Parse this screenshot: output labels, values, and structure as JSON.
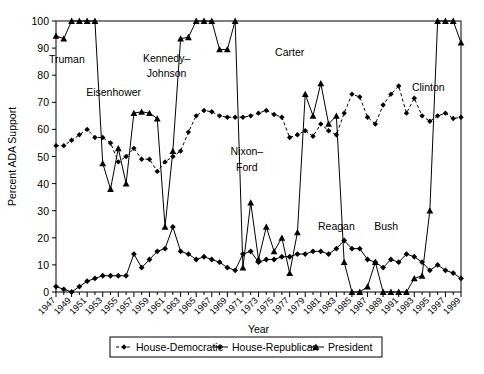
{
  "chart_data": {
    "type": "line",
    "title": "",
    "xlabel": "Year",
    "ylabel": "Percent ADA Support",
    "xlim": [
      1947,
      1999
    ],
    "ylim": [
      0,
      100
    ],
    "yticks": [
      0,
      10,
      20,
      30,
      40,
      50,
      60,
      70,
      80,
      90,
      100
    ],
    "grid": false,
    "legend_position": "bottom",
    "x": [
      1947,
      1948,
      1949,
      1950,
      1951,
      1952,
      1953,
      1954,
      1955,
      1956,
      1957,
      1958,
      1959,
      1960,
      1961,
      1962,
      1963,
      1964,
      1965,
      1966,
      1967,
      1968,
      1969,
      1970,
      1971,
      1972,
      1973,
      1974,
      1975,
      1976,
      1977,
      1978,
      1979,
      1980,
      1981,
      1982,
      1983,
      1984,
      1985,
      1986,
      1987,
      1988,
      1989,
      1990,
      1991,
      1992,
      1993,
      1994,
      1995,
      1996,
      1997,
      1998,
      1999
    ],
    "xtick_labels": [
      "1947",
      "1949",
      "1951",
      "1953",
      "1955",
      "1957",
      "1959",
      "1961",
      "1963",
      "1965",
      "1967",
      "1969",
      "1971",
      "1973",
      "1975",
      "1977",
      "1979",
      "1981",
      "1983",
      "1985",
      "1987",
      "1989",
      "1991",
      "1993",
      "1995",
      "1997",
      "1999"
    ],
    "series": [
      {
        "name": "House-Democratic",
        "marker": "diamond",
        "linestyle": "dashed",
        "color": "#000000",
        "values": [
          54,
          54,
          56,
          58,
          60,
          57,
          57,
          55,
          48,
          50,
          53,
          49,
          49,
          44.5,
          48,
          50,
          52,
          59,
          65,
          67,
          66.5,
          65,
          64.5,
          64.5,
          64.5,
          65,
          66,
          67,
          65.5,
          64.5,
          57,
          58,
          59.5,
          57.5,
          62,
          59.5,
          58,
          66,
          73,
          72,
          64.5,
          62,
          69,
          73,
          76,
          66,
          71.5,
          65,
          63,
          65,
          66,
          64,
          64.5
        ]
      },
      {
        "name": "House-Republican",
        "marker": "filled-diamond",
        "linestyle": "solid",
        "color": "#000000",
        "values": [
          2,
          1,
          0,
          2,
          4,
          5,
          6,
          6,
          6,
          6,
          14,
          9,
          12,
          15,
          16,
          24,
          15,
          14,
          12,
          13,
          12,
          11,
          9,
          8,
          14,
          15,
          11,
          12,
          12,
          13,
          13,
          14,
          14,
          15,
          15,
          14,
          16,
          19,
          16,
          16,
          12,
          11,
          9,
          12,
          11,
          14,
          13,
          11,
          8,
          10,
          8,
          7,
          5
        ]
      },
      {
        "name": "President",
        "marker": "triangle",
        "linestyle": "solid",
        "color": "#000000",
        "values": [
          94.5,
          93.5,
          100,
          100,
          100,
          100,
          47.5,
          38,
          53,
          40,
          66,
          66.5,
          66,
          64,
          24,
          52,
          93.5,
          94,
          100,
          100,
          100,
          89.5,
          89.5,
          100,
          9,
          33,
          12,
          24,
          15,
          20,
          7,
          22,
          73,
          65,
          77,
          62,
          65,
          11,
          0,
          0,
          2,
          11,
          0,
          0,
          0,
          0,
          5,
          6,
          30,
          100,
          100,
          100,
          92
        ]
      }
    ],
    "annotations": [
      {
        "text": "Truman",
        "x": 1948.4,
        "y": 84.5
      },
      {
        "text": "Eisenhower",
        "x": 1954.4,
        "y": 72.5
      },
      {
        "text": "Kennedy–",
        "x": 1961.2,
        "y": 85.0
      },
      {
        "text": "Johnson",
        "x": 1961.2,
        "y": 79.2
      },
      {
        "text": "Nixon–",
        "x": 1971.5,
        "y": 50.5
      },
      {
        "text": "Ford",
        "x": 1971.5,
        "y": 44.5
      },
      {
        "text": "Carter",
        "x": 1977.0,
        "y": 87.0
      },
      {
        "text": "Reagan",
        "x": 1983.0,
        "y": 23.0
      },
      {
        "text": "Bush",
        "x": 1989.4,
        "y": 23.0
      },
      {
        "text": "Clinton",
        "x": 1994.8,
        "y": 74.0
      }
    ]
  },
  "legend": {
    "items": [
      {
        "label": "House-Democratic",
        "marker": "diamond",
        "linestyle": "dashed"
      },
      {
        "label": "House-Republican",
        "marker": "filled-diamond",
        "linestyle": "solid"
      },
      {
        "label": "President",
        "marker": "triangle",
        "linestyle": "solid"
      }
    ]
  }
}
